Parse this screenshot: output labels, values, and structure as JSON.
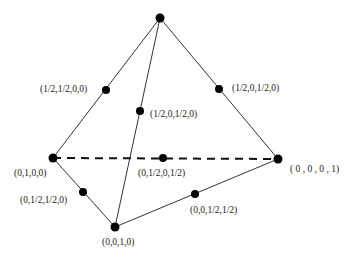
{
  "diagram": {
    "type": "tetrahedron",
    "vertices": [
      {
        "id": "top",
        "x": 160,
        "y": 18
      },
      {
        "id": "v_0100",
        "x": 53,
        "y": 158,
        "label": "(0,1,0,0)"
      },
      {
        "id": "v_0010",
        "x": 115,
        "y": 227,
        "label": "(0,0,1,0)"
      },
      {
        "id": "v_0001",
        "x": 278,
        "y": 159,
        "label": "( 0 , 0 , 0 , 1)"
      }
    ],
    "midpoints": [
      {
        "id": "m_half_half_00",
        "x": 106,
        "y": 90,
        "label": "(1/2,1/2,0,0)"
      },
      {
        "id": "m_half0half0",
        "x": 140,
        "y": 111,
        "label": "(1/2,0,1/2,0)"
      },
      {
        "id": "m_half00half_right",
        "x": 219,
        "y": 89,
        "label": "(1/2,0,1/2,0)"
      },
      {
        "id": "m_0half0half",
        "x": 163,
        "y": 158,
        "label": "(0,1/2,0,1/2)"
      },
      {
        "id": "m_0halfhalf0",
        "x": 83,
        "y": 192,
        "label": "(0,1/2,1/2,0)"
      },
      {
        "id": "m_00halfhalf",
        "x": 195,
        "y": 194,
        "label": "(0,0,1/2,1/2)"
      }
    ],
    "edges": [
      {
        "from": "top",
        "to": "v_0100",
        "style": "solid"
      },
      {
        "from": "top",
        "to": "v_0010",
        "style": "solid"
      },
      {
        "from": "top",
        "to": "v_0001",
        "style": "solid"
      },
      {
        "from": "v_0100",
        "to": "v_0010",
        "style": "solid"
      },
      {
        "from": "v_0010",
        "to": "v_0001",
        "style": "solid"
      },
      {
        "from": "v_0100",
        "to": "v_0001",
        "style": "dashed"
      }
    ],
    "colors": {
      "line": "#333333",
      "dot": "#000000",
      "text": "#222222"
    }
  },
  "labels": {
    "l_half_half_00": "(1/2,1/2,0,0)",
    "l_half0half0_right": "(1/2,0,1/2,0)",
    "l_half0half0_mid": "(1/2,0,1/2,0)",
    "l_0100": "(0,1,0,0)",
    "l_0half0half": "(0,1/2,0,1/2)",
    "l_0001": "( 0 , 0 , 0 , 1)",
    "l_0halfhalf0": "(0,1/2,1/2,0)",
    "l_00halfhalf": "(0,0,1/2,1/2)",
    "l_0010": "(0,0,1,0)"
  }
}
